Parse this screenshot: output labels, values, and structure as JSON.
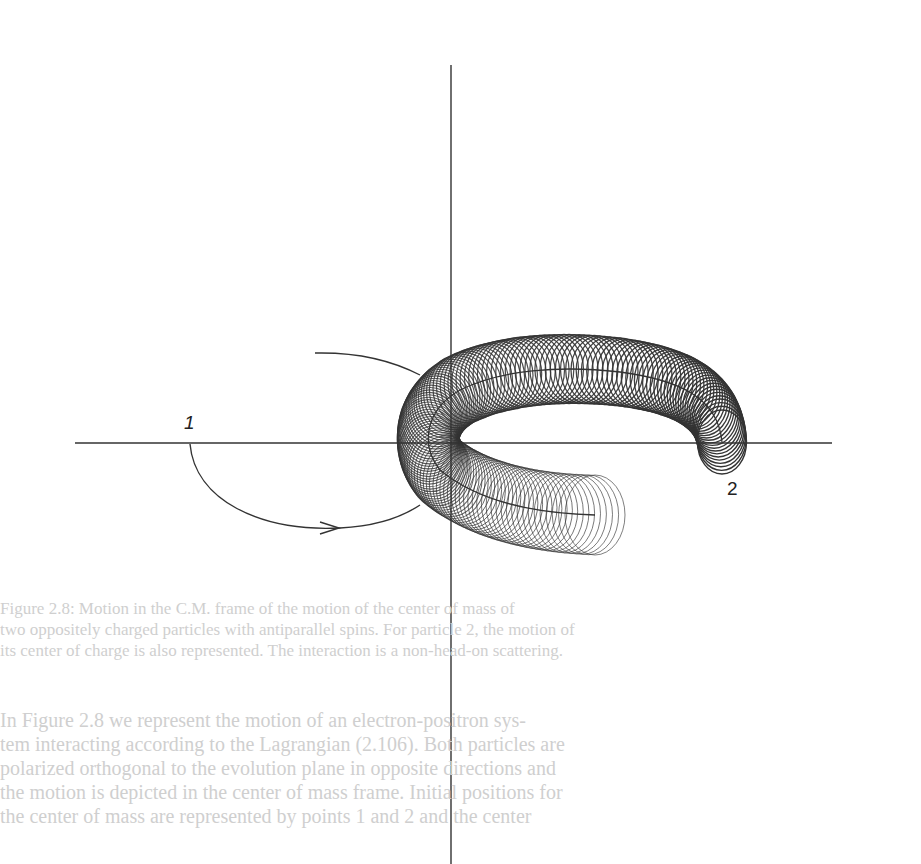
{
  "figure": {
    "labels": {
      "particle_1": "1",
      "particle_2": "2"
    },
    "axes": {
      "origin": [
        451,
        443
      ],
      "vertical": {
        "x": 451,
        "y1": 65,
        "y2": 864
      },
      "horizontal": {
        "y": 443,
        "x1": 75,
        "x2": 832
      }
    },
    "ink_color": "#333333"
  },
  "caption": {
    "lines": [
      "Figure 2.8: Motion in the C.M. frame of the motion of the center of mass of",
      "two oppositely charged particles with antiparallel spins. For particle 2, the motion of",
      "its center of charge is also represented. The interaction is a non-head-on scattering."
    ]
  },
  "body": {
    "lines": [
      "In Figure 2.8 we represent the motion of an electron-positron sys-",
      "tem interacting according to the Lagrangian (2.106). Both particles are",
      "polarized orthogonal to the evolution plane in opposite directions and",
      "the motion is depicted in the center of mass frame. Initial positions for",
      "the center of mass are represented by points 1 and 2 and the center"
    ]
  }
}
